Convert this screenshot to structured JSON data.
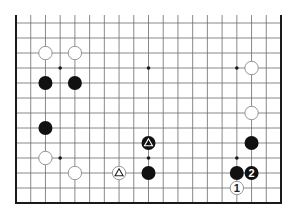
{
  "diagram": {
    "type": "go-board-fragment",
    "columns": 19,
    "rows_visible": 13,
    "edges": [
      "left",
      "right",
      "bottom"
    ],
    "colors": {
      "grid": "#6b6b6b",
      "edge": "#1a1a1a",
      "black_stone": "#111111",
      "white_stone": "#ffffff",
      "white_stroke": "#8a8a8a"
    },
    "star_points": [
      {
        "col": 3,
        "row": 3
      },
      {
        "col": 9,
        "row": 3
      },
      {
        "col": 15,
        "row": 3
      },
      {
        "col": 3,
        "row": 9
      },
      {
        "col": 9,
        "row": 9
      },
      {
        "col": 15,
        "row": 9
      }
    ],
    "stones": [
      {
        "color": "white",
        "col": 2,
        "row": 2,
        "mark": ""
      },
      {
        "color": "white",
        "col": 4,
        "row": 2,
        "mark": ""
      },
      {
        "color": "black",
        "col": 2,
        "row": 4,
        "mark": ""
      },
      {
        "color": "black",
        "col": 4,
        "row": 4,
        "mark": ""
      },
      {
        "color": "black",
        "col": 2,
        "row": 7,
        "mark": ""
      },
      {
        "color": "white",
        "col": 2,
        "row": 9,
        "mark": ""
      },
      {
        "color": "white",
        "col": 4,
        "row": 10,
        "mark": ""
      },
      {
        "color": "white",
        "col": 7,
        "row": 10,
        "mark": "triangle"
      },
      {
        "color": "black",
        "col": 9,
        "row": 8,
        "mark": "triangle"
      },
      {
        "color": "black",
        "col": 9,
        "row": 10,
        "mark": ""
      },
      {
        "color": "white",
        "col": 16,
        "row": 3,
        "mark": ""
      },
      {
        "color": "white",
        "col": 16,
        "row": 6,
        "mark": ""
      },
      {
        "color": "black",
        "col": 16,
        "row": 8,
        "mark": ""
      },
      {
        "color": "black",
        "col": 15,
        "row": 10,
        "mark": ""
      },
      {
        "color": "black",
        "col": 16,
        "row": 10,
        "mark": "2"
      },
      {
        "color": "white",
        "col": 15,
        "row": 11,
        "mark": "1"
      }
    ]
  }
}
